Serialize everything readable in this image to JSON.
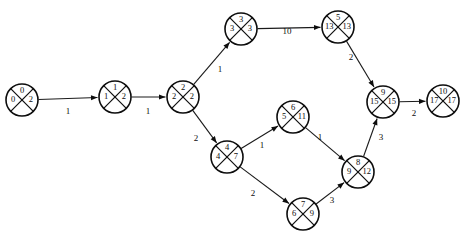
{
  "diagram": {
    "type": "network-activity-on-node-graph",
    "title": "",
    "node_radius": 16,
    "nodes": [
      {
        "id": "n0",
        "x": 22,
        "y": 100,
        "top": "0",
        "left": "0",
        "right": "2",
        "bottom": ""
      },
      {
        "id": "n1",
        "x": 115,
        "y": 97,
        "top": "1",
        "left": "1",
        "right": "2",
        "bottom": ""
      },
      {
        "id": "n2",
        "x": 183,
        "y": 97,
        "top": "2",
        "left": "2",
        "right": "2",
        "bottom": ""
      },
      {
        "id": "n3",
        "x": 241,
        "y": 29,
        "top": "3",
        "left": "3",
        "right": "3",
        "bottom": ""
      },
      {
        "id": "n5",
        "x": 338,
        "y": 27,
        "top": "5",
        "left": "13",
        "right": "13",
        "bottom": ""
      },
      {
        "id": "n4",
        "x": 227,
        "y": 157,
        "top": "4",
        "left": "4",
        "right": "7",
        "bottom": ""
      },
      {
        "id": "n6",
        "x": 293,
        "y": 117,
        "top": "6",
        "left": "5",
        "right": "11",
        "bottom": ""
      },
      {
        "id": "n8",
        "x": 358,
        "y": 172,
        "top": "8",
        "left": "9",
        "right": "12",
        "bottom": ""
      },
      {
        "id": "n7",
        "x": 303,
        "y": 214,
        "top": "7",
        "left": "6",
        "right": "9",
        "bottom": ""
      },
      {
        "id": "n9",
        "x": 383,
        "y": 102,
        "top": "9",
        "left": "15",
        "right": "15",
        "bottom": ""
      },
      {
        "id": "n10",
        "x": 443,
        "y": 101,
        "top": "10",
        "left": "17",
        "right": "17",
        "bottom": ""
      }
    ],
    "edges": [
      {
        "from": "n0",
        "to": "n1",
        "label": "1",
        "lx": 68,
        "ly": 112
      },
      {
        "from": "n1",
        "to": "n2",
        "label": "1",
        "lx": 148,
        "ly": 112
      },
      {
        "from": "n2",
        "to": "n3",
        "label": "1",
        "lx": 220,
        "ly": 70
      },
      {
        "from": "n3",
        "to": "n5",
        "label": "10",
        "lx": 287,
        "ly": 32
      },
      {
        "from": "n2",
        "to": "n4",
        "label": "2",
        "lx": 196,
        "ly": 139
      },
      {
        "from": "n5",
        "to": "n9",
        "label": "2",
        "lx": 351,
        "ly": 58
      },
      {
        "from": "n4",
        "to": "n6",
        "label": "1",
        "lx": 262,
        "ly": 146
      },
      {
        "from": "n6",
        "to": "n8",
        "label": "1",
        "lx": 320,
        "ly": 138
      },
      {
        "from": "n4",
        "to": "n7",
        "label": "2",
        "lx": 253,
        "ly": 194
      },
      {
        "from": "n7",
        "to": "n8",
        "label": "3",
        "lx": 332,
        "ly": 201
      },
      {
        "from": "n8",
        "to": "n9",
        "label": "3",
        "lx": 381,
        "ly": 138
      },
      {
        "from": "n9",
        "to": "n10",
        "label": "2",
        "lx": 414,
        "ly": 114
      }
    ]
  }
}
